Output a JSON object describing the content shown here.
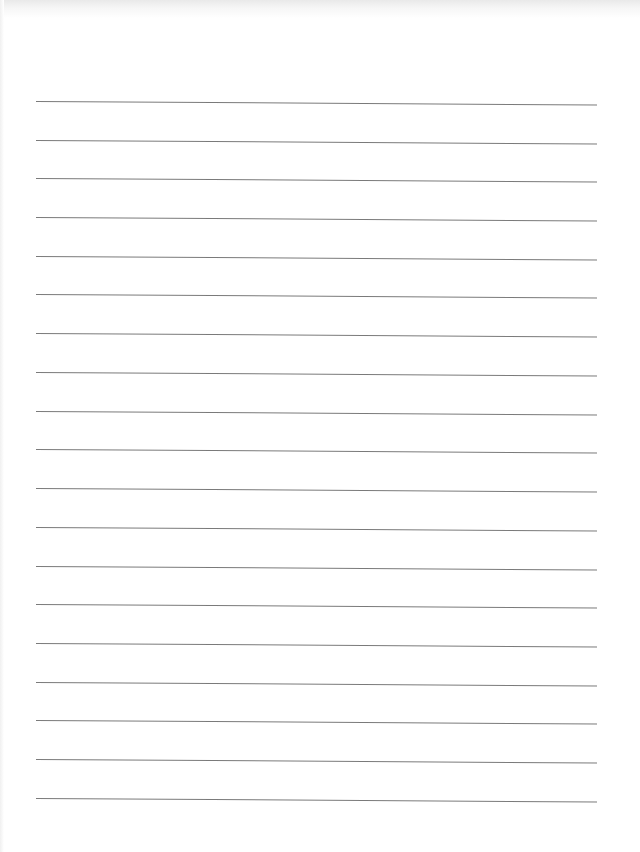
{
  "page": {
    "type": "lined-paper",
    "background_color": "#ffffff",
    "line_color": "#7a7a7a",
    "line_count": 19,
    "lines": [
      {
        "y": 101
      },
      {
        "y": 140
      },
      {
        "y": 178
      },
      {
        "y": 217
      },
      {
        "y": 256
      },
      {
        "y": 294
      },
      {
        "y": 333
      },
      {
        "y": 372
      },
      {
        "y": 411
      },
      {
        "y": 449
      },
      {
        "y": 488
      },
      {
        "y": 527
      },
      {
        "y": 566
      },
      {
        "y": 604
      },
      {
        "y": 643
      },
      {
        "y": 682
      },
      {
        "y": 720
      },
      {
        "y": 759
      },
      {
        "y": 798
      }
    ]
  }
}
